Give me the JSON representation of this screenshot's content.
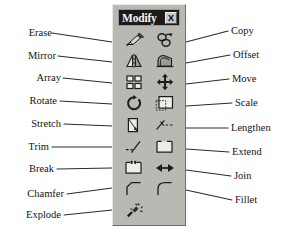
{
  "diagram": {
    "background_color": "#ffffff",
    "leader_line_color": "#2b2b2b"
  },
  "palette": {
    "title": "Modify",
    "close_label": "X",
    "face_color": "#b9b9b4",
    "titlebar_color": "#1b1b1b",
    "title_text_color": "#f4f4f0",
    "columns": 2,
    "rows": 9,
    "tools": [
      {
        "name": "Erase",
        "icon": "erase-icon",
        "column": "left",
        "row": 1
      },
      {
        "name": "Copy",
        "icon": "copy-icon",
        "column": "right",
        "row": 1
      },
      {
        "name": "Mirror",
        "icon": "mirror-icon",
        "column": "left",
        "row": 2
      },
      {
        "name": "Offset",
        "icon": "offset-icon",
        "column": "right",
        "row": 2
      },
      {
        "name": "Array",
        "icon": "array-icon",
        "column": "left",
        "row": 3
      },
      {
        "name": "Move",
        "icon": "move-icon",
        "column": "right",
        "row": 3
      },
      {
        "name": "Rotate",
        "icon": "rotate-icon",
        "column": "left",
        "row": 4
      },
      {
        "name": "Scale",
        "icon": "scale-icon",
        "column": "right",
        "row": 4
      },
      {
        "name": "Stretch",
        "icon": "stretch-icon",
        "column": "left",
        "row": 5
      },
      {
        "name": "Lengthen",
        "icon": "lengthen-icon",
        "column": "right",
        "row": 5
      },
      {
        "name": "Trim",
        "icon": "trim-icon",
        "column": "left",
        "row": 6
      },
      {
        "name": "Extend",
        "icon": "extend-icon",
        "column": "right",
        "row": 6
      },
      {
        "name": "Break",
        "icon": "break-icon",
        "column": "left",
        "row": 7
      },
      {
        "name": "Join",
        "icon": "join-icon",
        "column": "right",
        "row": 7
      },
      {
        "name": "Chamfer",
        "icon": "chamfer-icon",
        "column": "left",
        "row": 8
      },
      {
        "name": "Fillet",
        "icon": "fillet-icon",
        "column": "right",
        "row": 8
      },
      {
        "name": "Explode",
        "icon": "explode-icon",
        "column": "left",
        "row": 9
      }
    ]
  },
  "callouts": {
    "left": [
      {
        "label": "Erase"
      },
      {
        "label": "Mirror"
      },
      {
        "label": "Array"
      },
      {
        "label": "Rotate"
      },
      {
        "label": "Stretch"
      },
      {
        "label": "Trim"
      },
      {
        "label": "Break"
      },
      {
        "label": "Chamfer"
      },
      {
        "label": "Explode"
      }
    ],
    "right": [
      {
        "label": "Copy"
      },
      {
        "label": "Offset"
      },
      {
        "label": "Move"
      },
      {
        "label": "Scale"
      },
      {
        "label": "Lengthen"
      },
      {
        "label": "Extend"
      },
      {
        "label": "Join"
      },
      {
        "label": "Fillet"
      }
    ]
  }
}
